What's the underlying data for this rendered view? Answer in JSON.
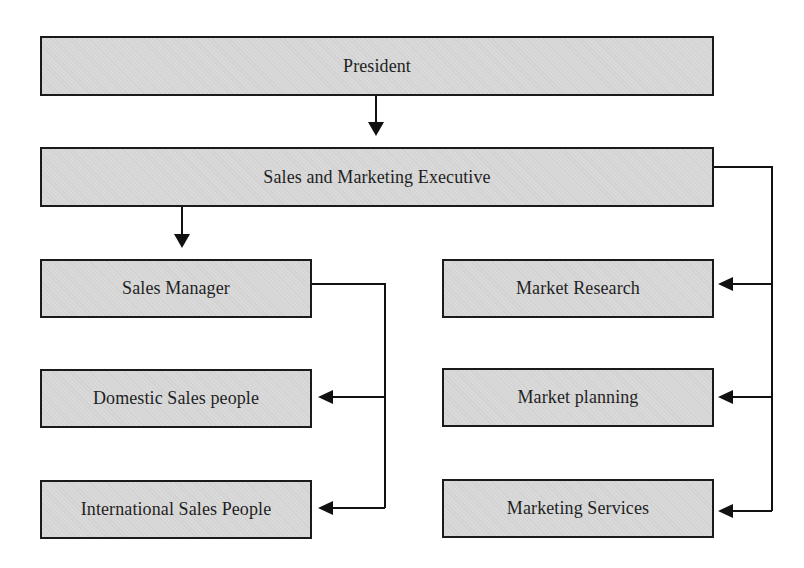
{
  "diagram": {
    "type": "org-chart",
    "nodes": {
      "president": "President",
      "executive": "Sales and Marketing Executive",
      "sales_manager": "Sales Manager",
      "domestic": "Domestic Sales people",
      "international": "International Sales People",
      "market_research": "Market Research",
      "market_planning": "Market planning",
      "marketing_services": "Marketing Services"
    },
    "edges": [
      {
        "from": "President",
        "to": "Sales and Marketing Executive"
      },
      {
        "from": "Sales and Marketing Executive",
        "to": "Sales Manager"
      },
      {
        "from": "Sales and Marketing Executive",
        "to": "Market Research"
      },
      {
        "from": "Sales and Marketing Executive",
        "to": "Market planning"
      },
      {
        "from": "Sales and Marketing Executive",
        "to": "Marketing Services"
      },
      {
        "from": "Sales Manager",
        "to": "Domestic Sales people"
      },
      {
        "from": "Sales Manager",
        "to": "International Sales People"
      }
    ],
    "colors": {
      "box_fill": "#d9d9d9",
      "box_border": "#1a1a1a",
      "line": "#111111",
      "text": "#1f1f1f"
    }
  }
}
